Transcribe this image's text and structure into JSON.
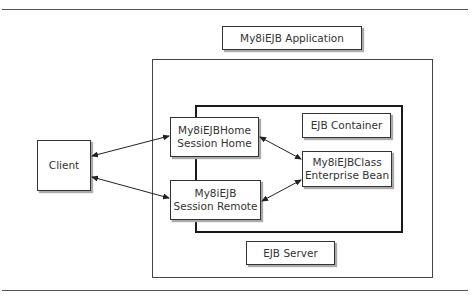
{
  "diagram": {
    "title": "My8iEJB Application",
    "client": {
      "label": "Client"
    },
    "home": {
      "line1": "My8iEJBHome",
      "line2": "Session Home"
    },
    "remote": {
      "line1": "My8iEJB",
      "line2": "Session Remote"
    },
    "container": {
      "label": "EJB Container"
    },
    "bean": {
      "line1": "My8iEJBClass",
      "line2": "Enterprise Bean"
    },
    "server": {
      "label": "EJB Server"
    },
    "connections": [
      {
        "from": "client",
        "to": "home",
        "type": "bidirectional"
      },
      {
        "from": "client",
        "to": "remote",
        "type": "bidirectional"
      },
      {
        "from": "home",
        "to": "bean",
        "type": "bidirectional"
      },
      {
        "from": "remote",
        "to": "bean",
        "type": "bidirectional"
      }
    ]
  }
}
